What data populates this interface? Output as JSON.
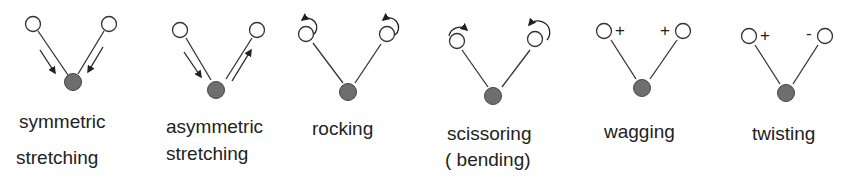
{
  "colors": {
    "atom_open_stroke": "#333333",
    "atom_center_fill": "#6e6e6e",
    "bond": "#333333",
    "text": "#222222"
  },
  "modes": [
    {
      "id": "symmetric-stretching",
      "label_line1": "symmetric",
      "label_line2": "stretching",
      "marker": "arrows-both-inward"
    },
    {
      "id": "asymmetric-stretching",
      "label_line1": "asymmetric",
      "label_line2": "stretching",
      "marker": "arrows-one-in-one-out"
    },
    {
      "id": "rocking",
      "label_line1": "rocking",
      "label_line2": "",
      "marker": "rotation-same-direction"
    },
    {
      "id": "scissoring",
      "label_line1": "scissoring",
      "label_line2": "( bending)",
      "marker": "rotation-opposite-direction"
    },
    {
      "id": "wagging",
      "label_line1": "wagging",
      "label_line2": "",
      "sign_left": "+",
      "sign_right": "+"
    },
    {
      "id": "twisting",
      "label_line1": "twisting",
      "label_line2": "",
      "sign_left": "+",
      "sign_right": "-"
    }
  ]
}
